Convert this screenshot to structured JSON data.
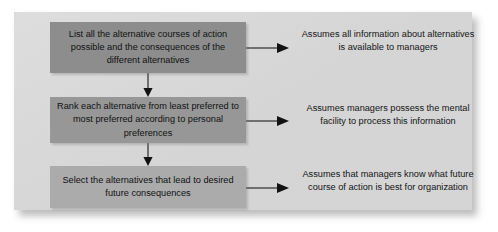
{
  "diagram": {
    "frame": {
      "background_color": "#d4d4d4",
      "shadow": true
    },
    "steps": [
      {
        "id": "step-1",
        "label": "List all the alternative courses of action possible and the consequences of the different alternatives",
        "fill_color": "#8d8d8d"
      },
      {
        "id": "step-2",
        "label": "Rank each alternative from least preferred to most preferred according to personal preferences",
        "fill_color": "#979797"
      },
      {
        "id": "step-3",
        "label": "Select the alternatives that lead to desired future consequences",
        "fill_color": "#ababab"
      }
    ],
    "assumptions": [
      {
        "id": "assumption-1",
        "label": "Assumes all information about alternatives is available to managers"
      },
      {
        "id": "assumption-2",
        "label": "Assumes managers possess the mental facility to process this information"
      },
      {
        "id": "assumption-3",
        "label": "Assumes that managers know what future course of action is best for organization"
      }
    ],
    "connectors": {
      "vertical_flow": [
        {
          "id": "flow-1-to-2",
          "from": "step-1",
          "to": "step-2",
          "direction": "down"
        },
        {
          "id": "flow-2-to-3",
          "from": "step-2",
          "to": "step-3",
          "direction": "down"
        }
      ],
      "horizontal_flow": [
        {
          "id": "link-1",
          "from": "step-1",
          "to": "assumption-1",
          "direction": "right"
        },
        {
          "id": "link-2",
          "from": "step-2",
          "to": "assumption-2",
          "direction": "right"
        },
        {
          "id": "link-3",
          "from": "step-3",
          "to": "assumption-3",
          "direction": "right"
        }
      ],
      "line_color": "#1c1c1c"
    }
  }
}
